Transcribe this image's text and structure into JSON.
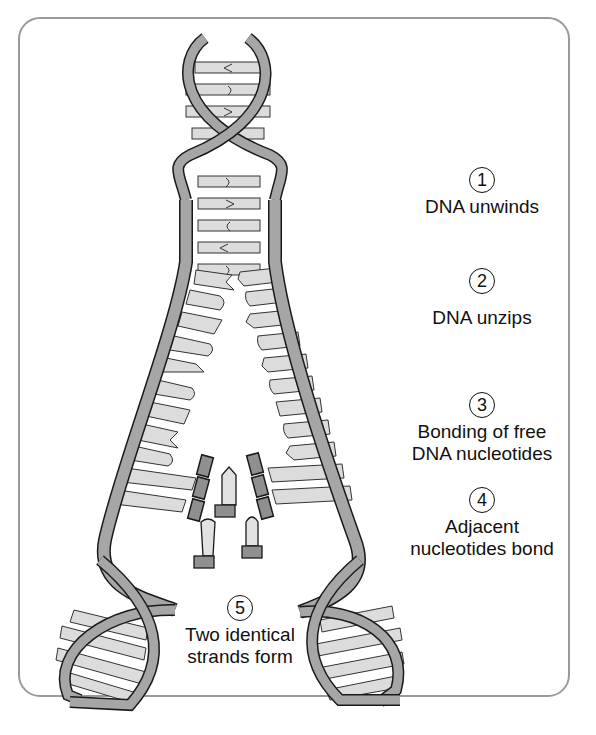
{
  "diagram": {
    "colors": {
      "backbone": "#a6a6a6",
      "backbone_stroke": "#1a1a1a",
      "base": "#dcdcdc",
      "free_cap": "#8f8f8f",
      "frame": "#9a9a9a",
      "text": "#111111"
    },
    "steps": [
      {
        "number": "1",
        "lines": [
          "DNA unwinds"
        ]
      },
      {
        "number": "2",
        "lines": [
          "DNA unzips"
        ]
      },
      {
        "number": "3",
        "lines": [
          "Bonding of free",
          "DNA nucleotides"
        ]
      },
      {
        "number": "4",
        "lines": [
          "Adjacent",
          "nucleotides bond"
        ]
      },
      {
        "number": "5",
        "lines": [
          "Two identical",
          "strands form"
        ]
      }
    ]
  }
}
